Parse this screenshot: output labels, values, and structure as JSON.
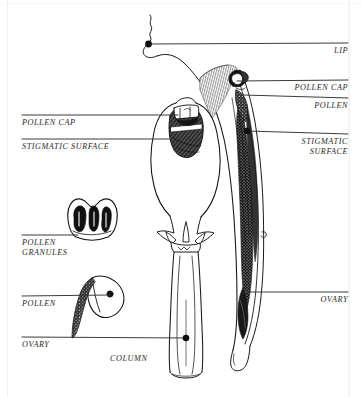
{
  "diagram": {
    "ink_color": "#1a1a1a",
    "background_color": "#ffffff",
    "leader_color": "#333333"
  },
  "labels": {
    "lip": "LIP",
    "pollen_cap_right": "POLLEN CAP",
    "pollen_right": "POLLEN",
    "stigmatic_surface_right_line1": "STIGMATIC",
    "stigmatic_surface_right_line2": "SURFACE",
    "ovary_right": "OVARY",
    "pollen_cap_left": "POLLEN CAP",
    "stigmatic_surface_left": "STIGMATIC SURFACE",
    "pollen_granules_line1": "POLLEN",
    "pollen_granules_line2": "GRANULES",
    "pollen_left": "POLLEN",
    "ovary_left": "OVARY",
    "column": "COLUMN"
  },
  "views": {
    "front_view": "column front view",
    "longitudinal_section": "flower longitudinal section",
    "inset_pollen_granules": "pollen granules detail",
    "inset_pollen": "pollen mass detail"
  }
}
